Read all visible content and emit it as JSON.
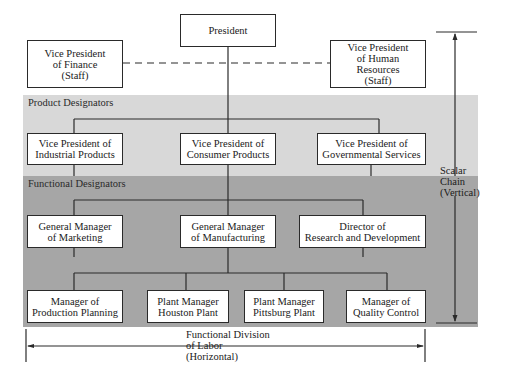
{
  "bands": {
    "product": {
      "label": "Product\nDesignators",
      "color": "#d8d8d8"
    },
    "functional": {
      "label": "Functional\nDesignators",
      "color": "#a6a6a6"
    }
  },
  "top": {
    "president": "President",
    "vp_finance": "Vice President\nof Finance\n(Staff)",
    "vp_hr": "Vice President\nof Human\nResources\n(Staff)"
  },
  "product_level": [
    "Vice President of\nIndustrial Products",
    "Vice President of\nConsumer Products",
    "Vice President of\nGovernmental Services"
  ],
  "functional_level": [
    "General Manager\nof Marketing",
    "General Manager\nof Manufacturing",
    "Director of\nResearch and Development"
  ],
  "operating_level": [
    "Manager of\nProduction Planning",
    "Plant Manager\nHouston Plant",
    "Plant Manager\nPittsburg Plant",
    "Manager of\nQuality Control"
  ],
  "annotations": {
    "scalar_chain": "Scalar\nChain\n(Vertical)",
    "functional_division": "Functional Division\nof Labor\n(Horizontal)"
  }
}
